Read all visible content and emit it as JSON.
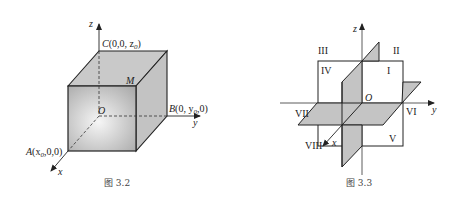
{
  "figures": [
    {
      "id": "fig-3-2",
      "caption": "图 3.2",
      "axes": {
        "x": "x",
        "y": "y",
        "z": "z"
      },
      "origin": "O",
      "point_m": "M",
      "point_a": {
        "name": "A",
        "coords_pre": "(x",
        "sub": "0",
        "coords_post": ",0,0)"
      },
      "point_b": {
        "name": "B",
        "coords_pre": "(0, y",
        "sub": "0",
        "coords_post": ",0)"
      },
      "point_c": {
        "name": "C",
        "coords_pre": "(0,0, z",
        "sub": "0",
        "coords_post": ")"
      },
      "colors": {
        "face_top": "#c9c9c9",
        "face_side": "#c2c2c2",
        "face_front_center": "#f4f4f4",
        "face_front_edge": "#a9a9a9",
        "edge": "#222222"
      }
    },
    {
      "id": "fig-3-3",
      "caption": "图 3.3",
      "axes": {
        "x": "x",
        "y": "y",
        "z": "z"
      },
      "origin": "O",
      "octants": [
        "I",
        "II",
        "III",
        "IV",
        "V",
        "VI",
        "VII",
        "VIII"
      ],
      "colors": {
        "plane_fill": "#c4c4c4",
        "edge": "#222222"
      }
    }
  ]
}
